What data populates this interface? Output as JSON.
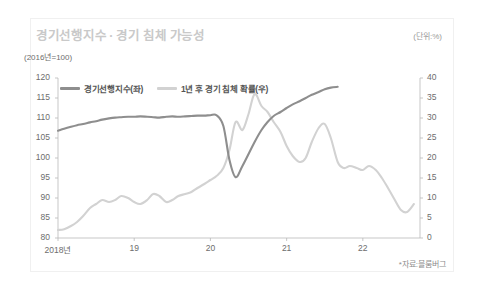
{
  "header": {
    "title": "경기선행지수 · 경기 침체 가능성",
    "unit_right": "(단위:%)",
    "unit_left": "(2016년=100)"
  },
  "legend": {
    "position": "top-left",
    "items": [
      {
        "label": "경기선행지수(좌)",
        "color": "#8e8e8e",
        "axis": "left"
      },
      {
        "label": "1년 후 경기 침체 확률(우)",
        "color": "#d2d2d2",
        "axis": "right"
      }
    ]
  },
  "footer": {
    "source": "*자료:블룸버그"
  },
  "colors": {
    "leading_index": "#8e8e8e",
    "recession_prob": "#d2d2d2",
    "axis": "#b9b9b9",
    "title": "#c9c9c9",
    "tick_text": "#6d6d6d",
    "background": "#ffffff",
    "card_border": "#f0f0f0"
  },
  "chart_data": {
    "type": "line",
    "title": "경기선행지수 · 경기 침체 가능성",
    "xlabel": "",
    "ylabel": "(2016년=100)",
    "y2label": "(단위:%)",
    "grid": false,
    "legend_position": "top-left",
    "xlim": [
      2018.0,
      2022.75
    ],
    "ylim": [
      80,
      120
    ],
    "y2lim": [
      0,
      40
    ],
    "yticks": [
      80,
      85,
      90,
      95,
      100,
      105,
      110,
      115,
      120
    ],
    "y2ticks": [
      0,
      5,
      10,
      15,
      20,
      25,
      30,
      35,
      40
    ],
    "xticks": [
      2018,
      2019,
      2020,
      2021,
      2022
    ],
    "xticklabels": [
      "2018년",
      "19",
      "20",
      "21",
      "22"
    ],
    "series": [
      {
        "name": "경기선행지수(좌)",
        "axis": "left",
        "color": "#8e8e8e",
        "x": [
          2018.0,
          2018.08,
          2018.17,
          2018.25,
          2018.33,
          2018.42,
          2018.5,
          2018.58,
          2018.67,
          2018.75,
          2018.83,
          2018.92,
          2019.0,
          2019.08,
          2019.17,
          2019.25,
          2019.33,
          2019.42,
          2019.5,
          2019.58,
          2019.67,
          2019.75,
          2019.83,
          2019.92,
          2020.0,
          2020.08,
          2020.17,
          2020.25,
          2020.33,
          2020.42,
          2020.58,
          2020.67,
          2020.75,
          2020.83,
          2020.92,
          2021.0,
          2021.08,
          2021.17,
          2021.25,
          2021.33,
          2021.42,
          2021.5,
          2021.58,
          2021.67
        ],
        "values": [
          106.8,
          107.3,
          107.8,
          108.2,
          108.5,
          108.9,
          109.2,
          109.6,
          109.9,
          110.1,
          110.2,
          110.3,
          110.3,
          110.4,
          110.3,
          110.2,
          110.1,
          110.3,
          110.4,
          110.3,
          110.4,
          110.5,
          110.6,
          110.6,
          110.7,
          110.7,
          108.0,
          99.5,
          95.2,
          98.0,
          104.0,
          107.0,
          109.0,
          110.5,
          111.5,
          112.5,
          113.4,
          114.2,
          115.0,
          115.8,
          116.5,
          117.2,
          117.6,
          117.8
        ]
      },
      {
        "name": "1년 후 경기 침체 확률(우)",
        "axis": "right",
        "color": "#d2d2d2",
        "x": [
          2018.0,
          2018.08,
          2018.17,
          2018.25,
          2018.33,
          2018.42,
          2018.5,
          2018.58,
          2018.67,
          2018.75,
          2018.83,
          2018.92,
          2019.0,
          2019.08,
          2019.17,
          2019.25,
          2019.33,
          2019.42,
          2019.5,
          2019.58,
          2019.67,
          2019.75,
          2019.83,
          2019.92,
          2020.0,
          2020.08,
          2020.17,
          2020.25,
          2020.33,
          2020.42,
          2020.5,
          2020.58,
          2020.67,
          2020.75,
          2020.83,
          2020.92,
          2021.0,
          2021.08,
          2021.17,
          2021.25,
          2021.33,
          2021.42,
          2021.5,
          2021.58,
          2021.67,
          2021.75,
          2021.83,
          2021.92,
          2022.0,
          2022.08,
          2022.17,
          2022.25,
          2022.33,
          2022.42,
          2022.5,
          2022.58,
          2022.67
        ],
        "values": [
          2.0,
          2.2,
          3.0,
          4.0,
          5.5,
          7.5,
          8.5,
          9.5,
          9.0,
          9.5,
          10.5,
          10.0,
          9.0,
          8.5,
          9.5,
          11.0,
          10.5,
          9.0,
          9.5,
          10.5,
          11.0,
          11.5,
          12.5,
          13.5,
          14.5,
          15.5,
          17.5,
          22.0,
          29.0,
          27.0,
          31.0,
          36.0,
          33.0,
          31.5,
          29.0,
          26.5,
          23.0,
          20.5,
          19.0,
          20.0,
          24.0,
          27.5,
          28.5,
          25.0,
          19.0,
          17.5,
          18.0,
          17.5,
          17.0,
          18.0,
          17.0,
          15.0,
          12.5,
          9.5,
          7.0,
          6.5,
          8.5
        ]
      }
    ]
  }
}
